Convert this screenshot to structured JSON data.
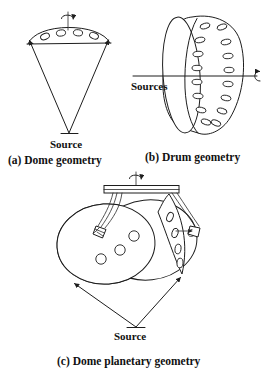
{
  "figure": {
    "panels": [
      {
        "id": "a",
        "caption": "(a) Dome geometry",
        "source_label": "Source",
        "rotation_icon": "rotation-arrow-icon",
        "substrate_shape": "dome-arc",
        "substrate_hole_count": 4
      },
      {
        "id": "b",
        "caption": "(b) Drum geometry",
        "source_label": "Sources",
        "rotation_icon": "rotation-arrow-icon",
        "substrate_shape": "drum-cylinder",
        "substrate_hole_count": 18
      },
      {
        "id": "c",
        "caption": "(c) Dome planetary geometry",
        "source_label": "Source",
        "rotation_icon": "rotation-arrow-icon",
        "planet_rotation_icon": "rotation-arrow-icon",
        "substrate_shape": "dome-planetary-discs",
        "disc_count": 2,
        "disc_hole_count": 3,
        "crescent_hole_count": 4
      }
    ],
    "colors": {
      "ink": "#1d1d1d",
      "background": "#ffffff",
      "text": "#111111"
    }
  }
}
